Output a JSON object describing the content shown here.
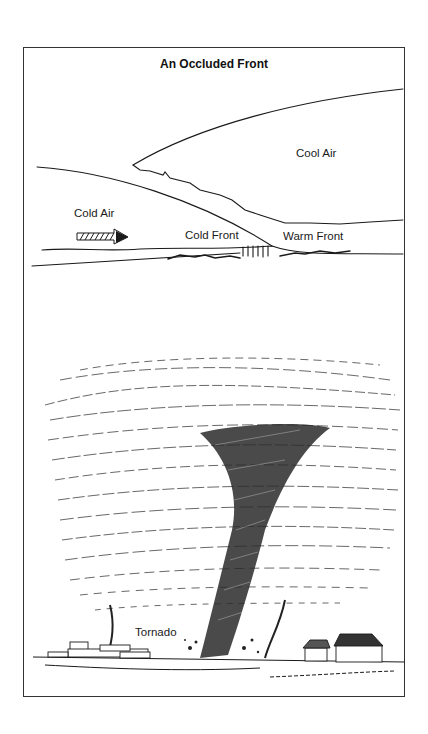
{
  "figure": {
    "title": "An Occluded Front",
    "labels": {
      "cool_air": "Cool Air",
      "cold_air": "Cold Air",
      "cold_front": "Cold Front",
      "warm_front": "Warm Front",
      "tornado": "Tornado"
    },
    "colors": {
      "ink": "#1a1a1a",
      "background": "#ffffff",
      "frame": "#333333"
    }
  }
}
